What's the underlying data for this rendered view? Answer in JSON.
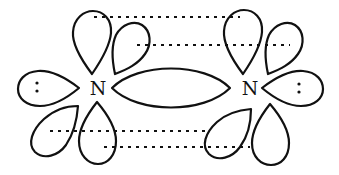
{
  "diagram": {
    "title": "",
    "atoms": [
      {
        "id": "N1",
        "label": "N",
        "x": 98,
        "y": 95
      },
      {
        "id": "N2",
        "label": "N",
        "x": 250,
        "y": 95
      }
    ],
    "lone_pairs": [
      {
        "atom": "N1",
        "symbol": ":"
      },
      {
        "atom": "N2",
        "symbol": ":"
      }
    ],
    "bonds": [
      {
        "type": "sigma",
        "from": "N1",
        "to": "N2",
        "shape": "lens"
      },
      {
        "type": "pi",
        "from": "N1",
        "to": "N2",
        "shape": "dotted-overlap",
        "position": "upper"
      },
      {
        "type": "pi",
        "from": "N1",
        "to": "N2",
        "shape": "dotted-overlap",
        "position": "lower"
      }
    ],
    "colors": {
      "stroke": "#111111",
      "background": "#ffffff"
    }
  }
}
